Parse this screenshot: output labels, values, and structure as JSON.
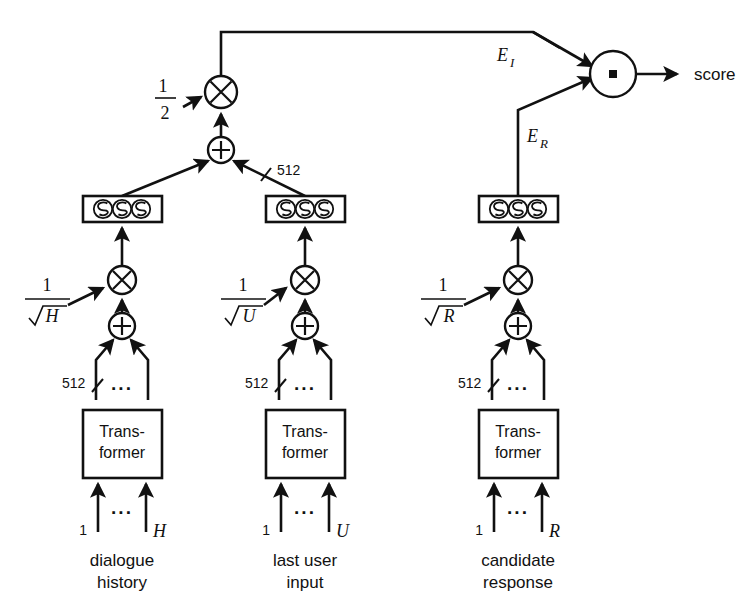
{
  "figure": {
    "background_color": "#ffffff",
    "ink_color": "#111111",
    "output_label": "score",
    "embedding_labels": {
      "input_embedding": "E",
      "input_embedding_sub": "I",
      "response_embedding": "E",
      "response_embedding_sub": "R"
    },
    "scale_half": {
      "numerator": "1",
      "denominator": "2"
    },
    "dim_label": "512",
    "dots": "···",
    "operators": {
      "multiply": "⊗",
      "add": "⊕",
      "dot_product": "▪"
    }
  },
  "columns": [
    {
      "id": "dialogue-history",
      "caption_line1": "dialogue",
      "caption_line2": "history",
      "block_label_line1": "Trans-",
      "block_label_line2": "former",
      "token_first": "1",
      "token_last": "H",
      "scale_numerator": "1",
      "scale_denominator_radicand": "H",
      "dim_label": "512",
      "dots": "···"
    },
    {
      "id": "last-user-input",
      "caption_line1": "last user",
      "caption_line2": "input",
      "block_label_line1": "Trans-",
      "block_label_line2": "former",
      "token_first": "1",
      "token_last": "U",
      "scale_numerator": "1",
      "scale_denominator_radicand": "U",
      "dim_label": "512",
      "dots": "···"
    },
    {
      "id": "candidate-response",
      "caption_line1": "candidate",
      "caption_line2": "response",
      "block_label_line1": "Trans-",
      "block_label_line2": "former",
      "token_first": "1",
      "token_last": "R",
      "scale_numerator": "1",
      "scale_denominator_radicand": "R",
      "dim_label": "512",
      "dots": "···"
    }
  ]
}
